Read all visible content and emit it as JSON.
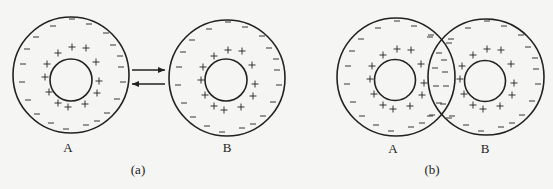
{
  "figure": {
    "panels": [
      {
        "id": "a",
        "caption": "(a)",
        "caption_pos": [
          138,
          170
        ],
        "arrows": [
          {
            "from": [
              132,
              70
            ],
            "to": [
              165,
              70
            ],
            "direction": "right"
          },
          {
            "from": [
              165,
              84
            ],
            "to": [
              132,
              84
            ],
            "direction": "left"
          }
        ],
        "particles": [
          {
            "label": "A",
            "label_pos": [
              68,
              148
            ],
            "outer": {
              "cx": 71,
              "cy": 75,
              "r": 58
            },
            "inner": {
              "cx": 71,
              "cy": 80,
              "r": 21
            }
          },
          {
            "label": "B",
            "label_pos": [
              227,
              148
            ],
            "outer": {
              "cx": 227,
              "cy": 78,
              "r": 58
            },
            "inner": {
              "cx": 226,
              "cy": 80,
              "r": 21
            }
          }
        ]
      },
      {
        "id": "b",
        "caption": "(b)",
        "caption_pos": [
          432,
          170
        ],
        "particles": [
          {
            "label": "A",
            "label_pos": [
              393,
              149
            ],
            "outer": {
              "cx": 396,
              "cy": 77,
              "r": 59
            },
            "inner": {
              "cx": 395,
              "cy": 80,
              "r": 20.5
            }
          },
          {
            "label": "B",
            "label_pos": [
              485,
              149
            ],
            "outer": {
              "cx": 486,
              "cy": 77,
              "r": 58
            },
            "inner": {
              "cx": 485,
              "cy": 81,
              "r": 20.5
            }
          }
        ],
        "overlap_negative_charges": [
          [
            439,
            53
          ],
          [
            444,
            60
          ],
          [
            435,
            68
          ],
          [
            445,
            72
          ],
          [
            436,
            86
          ],
          [
            446,
            86
          ],
          [
            439,
            103
          ],
          [
            443,
            104
          ],
          [
            430,
            37
          ],
          [
            449,
            43
          ],
          [
            430,
            116
          ],
          [
            449,
            118
          ]
        ]
      }
    ],
    "charge_pattern": {
      "positive_offsets": [
        [
          -13,
          -22
        ],
        [
          1,
          -28
        ],
        [
          15,
          -27
        ],
        [
          -24,
          -11
        ],
        [
          25,
          -13
        ],
        [
          -26,
          2
        ],
        [
          28,
          6
        ],
        [
          -22,
          17
        ],
        [
          26,
          18
        ],
        [
          -13,
          28
        ],
        [
          -3,
          32
        ],
        [
          14,
          29
        ]
      ],
      "negative_offsets": [
        [
          1,
          -56
        ],
        [
          -18,
          -49
        ],
        [
          18,
          -51
        ],
        [
          -35,
          -38
        ],
        [
          35,
          -42
        ],
        [
          -44,
          -26
        ],
        [
          42,
          -30
        ],
        [
          -48,
          -11
        ],
        [
          49,
          -19
        ],
        [
          -49,
          7
        ],
        [
          50,
          -8
        ],
        [
          -43,
          25
        ],
        [
          52,
          7
        ],
        [
          -34,
          39
        ],
        [
          46,
          24
        ],
        [
          -20,
          48
        ],
        [
          36,
          38
        ],
        [
          -5,
          54
        ],
        [
          15,
          50
        ],
        [
          26,
          46
        ]
      ]
    },
    "symbols": {
      "positive": "+",
      "negative": "−"
    },
    "colors": {
      "stroke": "#222222",
      "background": "#f5f5f3"
    }
  }
}
